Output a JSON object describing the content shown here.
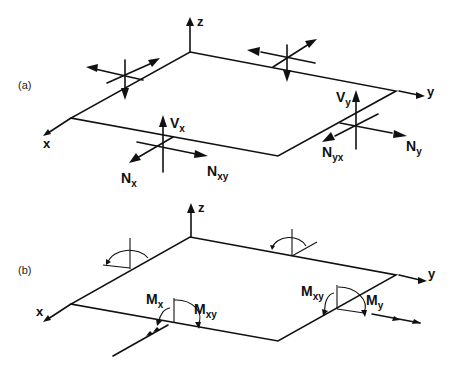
{
  "figure": {
    "panel_a": {
      "label": "(a)",
      "axes": {
        "x": "x",
        "y": "y",
        "z": "z"
      },
      "forces": {
        "Vx": {
          "main": "V",
          "sub": "x"
        },
        "Nx": {
          "main": "N",
          "sub": "x"
        },
        "Nxy": {
          "main": "N",
          "sub": "xy"
        },
        "Vy": {
          "main": "V",
          "sub": "y"
        },
        "Ny": {
          "main": "N",
          "sub": "y"
        },
        "Nyx": {
          "main": "N",
          "sub": "yx"
        }
      }
    },
    "panel_b": {
      "label": "(b)",
      "axes": {
        "x": "x",
        "y": "y",
        "z": "z"
      },
      "moments": {
        "Mx": {
          "main": "M",
          "sub": "x"
        },
        "Mxy_front": {
          "main": "M",
          "sub": "xy"
        },
        "Mxy_right": {
          "main": "M",
          "sub": "xy"
        },
        "My": {
          "main": "M",
          "sub": "y"
        }
      }
    },
    "colors": {
      "line": "#111111",
      "background": "#ffffff"
    }
  }
}
